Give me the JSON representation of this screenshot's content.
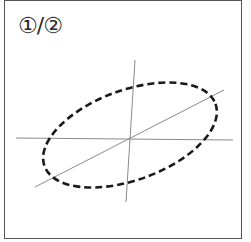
{
  "diagram": {
    "label": "①/②",
    "colors": {
      "frame": "#555555",
      "axis": "#8a8a8a",
      "ellipse": "#1a1a1a",
      "background": "#ffffff"
    },
    "axes": {
      "horizontal": {
        "x1": 16,
        "y1": 138,
        "x2": 233,
        "y2": 140
      },
      "vertical": {
        "x1": 135,
        "y1": 60,
        "x2": 126,
        "y2": 202
      },
      "diagonal": {
        "x1": 35,
        "y1": 187,
        "x2": 224,
        "y2": 90
      }
    },
    "ellipse": {
      "cx": 130,
      "cy": 135,
      "rx": 91,
      "ry": 45,
      "rotation": -20,
      "style": "dashed"
    }
  }
}
